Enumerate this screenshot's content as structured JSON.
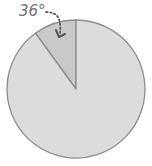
{
  "chart_data": {
    "type": "pie",
    "title": "",
    "total_degrees": 360,
    "slices": [
      {
        "name": "highlighted-sector",
        "degrees": 36,
        "color": "#c9c9c9"
      },
      {
        "name": "remaining-sector",
        "degrees": 324,
        "color": "#dcdcdc"
      }
    ],
    "start": "top",
    "direction": "counterclockwise",
    "annotation": {
      "text": "36°",
      "target": "highlighted-sector",
      "arrow_style": "dotted"
    }
  },
  "colors": {
    "outline": "#8c8c8c",
    "label": "#6e6e6e",
    "arrow": "#555555"
  }
}
